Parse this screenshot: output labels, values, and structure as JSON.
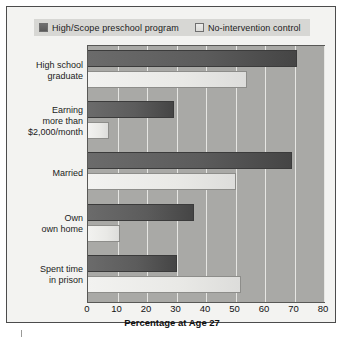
{
  "chart_data": {
    "type": "bar",
    "orientation": "horizontal",
    "title": "",
    "xlabel": "Percentage at Age 27",
    "ylabel": "",
    "xlim": [
      0,
      80
    ],
    "xticks": [
      0,
      10,
      20,
      30,
      40,
      50,
      60,
      70,
      80
    ],
    "grid": true,
    "legend_position": "top",
    "categories": [
      "High school graduate",
      "Earning more than $2,000/month",
      "Married",
      "Own own home",
      "Spent time in prison"
    ],
    "category_lines": [
      [
        "High school",
        "graduate"
      ],
      [
        "Earning",
        "more than",
        "$2,000/month"
      ],
      [
        "Married"
      ],
      [
        "Own",
        "own home"
      ],
      [
        "Spent time",
        "in prison"
      ]
    ],
    "series": [
      {
        "name": "High/Scope preschool program",
        "color": "#5c5c5c",
        "values": [
          71,
          29,
          69,
          36,
          30
        ]
      },
      {
        "name": "No-intervention control",
        "color": "#e9e9e6",
        "values": [
          54,
          7,
          50,
          11,
          52
        ]
      }
    ]
  },
  "legend": {
    "entries": [
      {
        "label": "High/Scope preschool program",
        "swatch": "dark-gray-swatch"
      },
      {
        "label": "No-intervention control",
        "swatch": "light-gray-swatch"
      }
    ]
  },
  "colors": {
    "series_dark": "#5c5c5c",
    "series_light": "#e9e9e6",
    "plot_background": "#a9a9a6",
    "gridline": "#e6e6e3",
    "page_background": "#f3f3f1",
    "frame_border": "#4c4c4c",
    "text": "#1b1b1b"
  }
}
